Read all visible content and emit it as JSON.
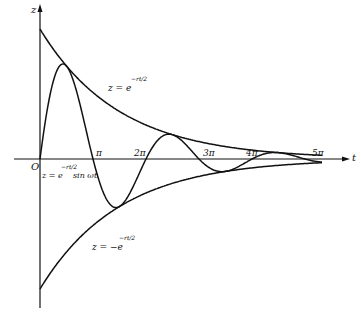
{
  "chart_data": {
    "type": "line",
    "title": "",
    "xlabel": "t",
    "ylabel": "z",
    "origin_label": "O",
    "x_ticks": [
      "π",
      "2π",
      "3π",
      "4π",
      "5π"
    ],
    "x_tick_values": [
      3.1416,
      6.2832,
      9.4248,
      12.5664,
      15.708
    ],
    "series": [
      {
        "name": "z = e^(-rt/2)",
        "type": "upper envelope",
        "x": [
          0,
          1.57,
          3.14,
          6.28,
          9.42,
          12.57,
          15.71
        ],
        "y": [
          1.0,
          0.72,
          0.51,
          0.27,
          0.14,
          0.07,
          0.04
        ]
      },
      {
        "name": "z = -e^(-rt/2)",
        "type": "lower envelope",
        "x": [
          0,
          1.57,
          3.14,
          6.28,
          9.42,
          12.57,
          15.71
        ],
        "y": [
          -1.0,
          -0.72,
          -0.51,
          -0.27,
          -0.14,
          -0.07,
          -0.04
        ]
      },
      {
        "name": "z = e^(-rt/2) sin ωt",
        "type": "damped oscillation",
        "x": [
          0,
          1.57,
          3.14,
          4.71,
          6.28,
          7.85,
          9.42,
          11.0,
          12.57,
          14.14,
          15.71
        ],
        "y": [
          0,
          0.72,
          0,
          -0.37,
          0,
          0.19,
          0,
          -0.1,
          0,
          0.05,
          0
        ]
      }
    ],
    "grid": false,
    "legend": "inline curve labels"
  },
  "labels": {
    "z_axis": "z",
    "t_axis": "t",
    "origin": "O",
    "pi1": "π",
    "pi2": "2π",
    "pi3": "3π",
    "pi4": "4π",
    "pi5": "5π",
    "upper_eq": "z = e",
    "upper_exp": "−rt/2",
    "lower_eq": "z = −e",
    "lower_exp": "−rt/2",
    "damped_eq": "z = e",
    "damped_exp": "−rt/2",
    "damped_tail": "sin ωt"
  }
}
